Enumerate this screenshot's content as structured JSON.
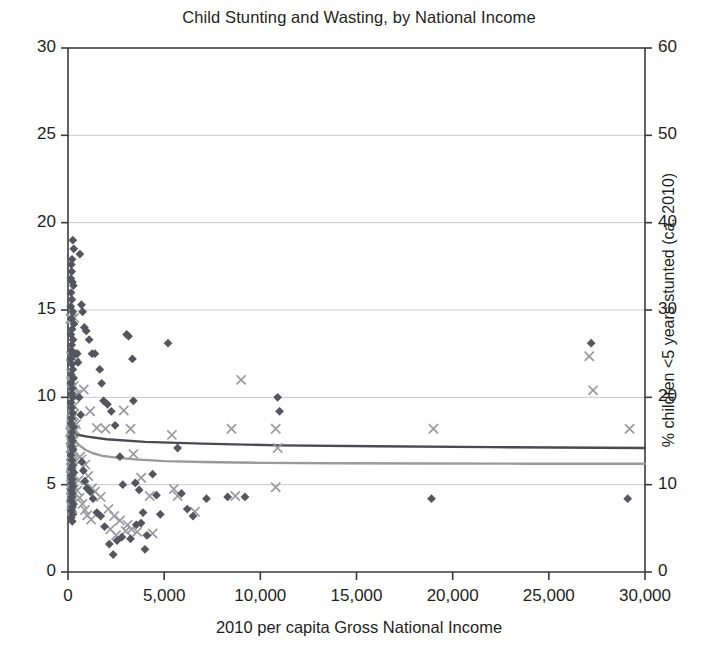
{
  "chart_data": {
    "type": "scatter",
    "title": "Child Stunting and Wasting, by National Income",
    "xlabel": "2010 per capita Gross National Income",
    "ylabel_left": "",
    "ylabel_right": "% children <5 years stunted (ca. 2010)",
    "xlim": [
      0,
      30000
    ],
    "ylim_left": [
      0,
      30
    ],
    "ylim_right": [
      0,
      60
    ],
    "xticks": [
      0,
      5000,
      10000,
      15000,
      20000,
      25000,
      30000
    ],
    "xticklabels": [
      "0",
      "5,000",
      "10,000",
      "15,000",
      "20,000",
      "25,000",
      "30,000"
    ],
    "yticks_left": [
      0,
      5,
      10,
      15,
      20,
      25,
      30
    ],
    "yticklabels_left": [
      "0",
      "5",
      "10",
      "15",
      "20",
      "25",
      "30"
    ],
    "yticks_right": [
      0,
      10,
      20,
      30,
      40,
      50,
      60
    ],
    "yticklabels_right": [
      "0",
      "10",
      "20",
      "30",
      "40",
      "50",
      "60"
    ],
    "grid": "horizontal",
    "legend_position": "none",
    "colors": {
      "stunting_marker": "#9a9a9e",
      "wasting_marker": "#55555f",
      "stunting_trend": "#9a9a9e",
      "wasting_trend": "#4a4a52",
      "axis": "#3a3a3a",
      "gridline": "#c8c8cc",
      "text": "#231f20"
    },
    "series": [
      {
        "name": "stunting",
        "marker": "x",
        "color": "#9a9a9e",
        "axis": "right",
        "points": [
          [
            120,
            29.0
          ],
          [
            200,
            29.0
          ],
          [
            330,
            29.1
          ],
          [
            150,
            24.7
          ],
          [
            250,
            24.7
          ],
          [
            380,
            24.8
          ],
          [
            160,
            22.7
          ],
          [
            180,
            21.9
          ],
          [
            200,
            21.6
          ],
          [
            300,
            21.3
          ],
          [
            240,
            20.3
          ],
          [
            360,
            20.2
          ],
          [
            430,
            20.3
          ],
          [
            330,
            19.0
          ],
          [
            180,
            18.4
          ],
          [
            260,
            18.0
          ],
          [
            210,
            17.8
          ],
          [
            170,
            17.2
          ],
          [
            300,
            17.0
          ],
          [
            160,
            16.8
          ],
          [
            420,
            16.9
          ],
          [
            200,
            16.5
          ],
          [
            150,
            16.2
          ],
          [
            360,
            16.3
          ],
          [
            110,
            16.0
          ],
          [
            250,
            15.9
          ],
          [
            190,
            15.5
          ],
          [
            140,
            15.2
          ],
          [
            320,
            15.1
          ],
          [
            170,
            14.8
          ],
          [
            230,
            14.5
          ],
          [
            130,
            14.2
          ],
          [
            280,
            14.0
          ],
          [
            190,
            13.6
          ],
          [
            150,
            13.3
          ],
          [
            210,
            13.0
          ],
          [
            250,
            12.7
          ],
          [
            170,
            12.3
          ],
          [
            140,
            11.9
          ],
          [
            200,
            11.5
          ],
          [
            160,
            11.2
          ],
          [
            230,
            10.9
          ],
          [
            180,
            10.6
          ],
          [
            300,
            10.3
          ],
          [
            150,
            10.0
          ],
          [
            210,
            9.7
          ],
          [
            170,
            9.4
          ],
          [
            250,
            9.1
          ],
          [
            190,
            8.8
          ],
          [
            140,
            8.5
          ],
          [
            220,
            8.2
          ],
          [
            180,
            7.9
          ],
          [
            160,
            7.6
          ],
          [
            240,
            7.3
          ],
          [
            200,
            7.0
          ],
          [
            820,
            20.9
          ],
          [
            1150,
            18.4
          ],
          [
            1500,
            16.5
          ],
          [
            1950,
            16.4
          ],
          [
            2900,
            18.5
          ],
          [
            3250,
            16.4
          ],
          [
            3400,
            13.5
          ],
          [
            3800,
            10.8
          ],
          [
            4250,
            8.7
          ],
          [
            5400,
            15.7
          ],
          [
            5500,
            9.5
          ],
          [
            5700,
            8.7
          ],
          [
            6600,
            6.9
          ],
          [
            8500,
            16.4
          ],
          [
            9000,
            22.0
          ],
          [
            8700,
            8.7
          ],
          [
            10800,
            16.4
          ],
          [
            10900,
            14.2
          ],
          [
            10800,
            9.7
          ],
          [
            19000,
            16.4
          ],
          [
            27100,
            24.7
          ],
          [
            27300,
            20.8
          ],
          [
            29200,
            16.4
          ],
          [
            620,
            13.2
          ],
          [
            700,
            12.9
          ],
          [
            900,
            12.3
          ],
          [
            1050,
            11.0
          ],
          [
            1250,
            9.6
          ],
          [
            1400,
            9.2
          ],
          [
            1700,
            8.6
          ],
          [
            2100,
            7.2
          ],
          [
            2400,
            6.4
          ],
          [
            2700,
            5.9
          ],
          [
            3100,
            5.4
          ],
          [
            3600,
            4.6
          ],
          [
            4400,
            4.4
          ],
          [
            550,
            10.5
          ],
          [
            480,
            9.3
          ],
          [
            600,
            8.5
          ],
          [
            750,
            7.8
          ],
          [
            880,
            7.1
          ],
          [
            1000,
            6.5
          ],
          [
            1200,
            6.0
          ],
          [
            2200,
            4.9
          ],
          [
            2500,
            4.2
          ],
          [
            3000,
            4.7
          ],
          [
            3300,
            4.9
          ]
        ]
      },
      {
        "name": "wasting",
        "marker": "diamond",
        "color": "#55555f",
        "axis": "left",
        "points": [
          [
            250,
            19.0
          ],
          [
            300,
            18.5
          ],
          [
            210,
            17.9
          ],
          [
            170,
            17.6
          ],
          [
            190,
            17.2
          ],
          [
            150,
            16.8
          ],
          [
            230,
            16.6
          ],
          [
            280,
            16.4
          ],
          [
            160,
            16.0
          ],
          [
            200,
            15.6
          ],
          [
            140,
            15.2
          ],
          [
            250,
            14.9
          ],
          [
            180,
            14.5
          ],
          [
            310,
            14.2
          ],
          [
            210,
            13.9
          ],
          [
            150,
            13.6
          ],
          [
            260,
            13.3
          ],
          [
            190,
            13.0
          ],
          [
            170,
            12.7
          ],
          [
            230,
            12.5
          ],
          [
            300,
            12.5
          ],
          [
            400,
            12.5
          ],
          [
            480,
            12.5
          ],
          [
            140,
            12.2
          ],
          [
            200,
            11.9
          ],
          [
            250,
            11.6
          ],
          [
            170,
            11.3
          ],
          [
            290,
            11.1
          ],
          [
            150,
            10.8
          ],
          [
            220,
            10.5
          ],
          [
            190,
            10.2
          ],
          [
            260,
            10.0
          ],
          [
            160,
            9.7
          ],
          [
            200,
            9.4
          ],
          [
            240,
            9.1
          ],
          [
            180,
            8.8
          ],
          [
            150,
            8.5
          ],
          [
            280,
            8.3
          ],
          [
            210,
            8.0
          ],
          [
            170,
            7.7
          ],
          [
            230,
            7.5
          ],
          [
            190,
            7.2
          ],
          [
            260,
            7.0
          ],
          [
            160,
            6.7
          ],
          [
            200,
            6.4
          ],
          [
            240,
            6.1
          ],
          [
            180,
            5.9
          ],
          [
            310,
            5.7
          ],
          [
            150,
            5.5
          ],
          [
            220,
            5.3
          ],
          [
            190,
            5.1
          ],
          [
            260,
            4.9
          ],
          [
            170,
            4.7
          ],
          [
            230,
            4.5
          ],
          [
            200,
            4.3
          ],
          [
            150,
            4.1
          ],
          [
            280,
            3.9
          ],
          [
            210,
            3.7
          ],
          [
            180,
            3.5
          ],
          [
            250,
            3.3
          ],
          [
            170,
            3.1
          ],
          [
            220,
            2.9
          ],
          [
            620,
            18.2
          ],
          [
            700,
            15.3
          ],
          [
            760,
            14.9
          ],
          [
            850,
            14.0
          ],
          [
            950,
            13.8
          ],
          [
            1100,
            13.3
          ],
          [
            1250,
            12.5
          ],
          [
            1400,
            12.5
          ],
          [
            1650,
            11.6
          ],
          [
            1750,
            10.8
          ],
          [
            1850,
            9.8
          ],
          [
            2050,
            9.6
          ],
          [
            2250,
            9.2
          ],
          [
            2450,
            8.4
          ],
          [
            2700,
            6.6
          ],
          [
            2850,
            5.0
          ],
          [
            3050,
            13.6
          ],
          [
            3150,
            13.5
          ],
          [
            3350,
            12.2
          ],
          [
            3400,
            9.8
          ],
          [
            3500,
            5.1
          ],
          [
            3700,
            4.7
          ],
          [
            3900,
            3.4
          ],
          [
            4100,
            2.1
          ],
          [
            4400,
            5.6
          ],
          [
            4600,
            4.4
          ],
          [
            4800,
            3.3
          ],
          [
            5200,
            13.1
          ],
          [
            5700,
            7.1
          ],
          [
            5900,
            4.5
          ],
          [
            6200,
            3.6
          ],
          [
            6500,
            3.2
          ],
          [
            7200,
            4.2
          ],
          [
            8300,
            4.3
          ],
          [
            9200,
            4.3
          ],
          [
            10900,
            10.0
          ],
          [
            11000,
            9.2
          ],
          [
            18900,
            4.2
          ],
          [
            27200,
            13.1
          ],
          [
            29100,
            4.2
          ],
          [
            520,
            12.0
          ],
          [
            580,
            10.0
          ],
          [
            660,
            9.0
          ],
          [
            720,
            6.3
          ],
          [
            800,
            5.8
          ],
          [
            880,
            5.2
          ],
          [
            980,
            4.8
          ],
          [
            1150,
            4.6
          ],
          [
            1300,
            4.2
          ],
          [
            1500,
            3.4
          ],
          [
            1700,
            3.2
          ],
          [
            1900,
            2.6
          ],
          [
            2150,
            1.6
          ],
          [
            2350,
            1.0
          ],
          [
            2550,
            1.8
          ],
          [
            2800,
            2.0
          ],
          [
            3250,
            1.9
          ],
          [
            3550,
            2.7
          ],
          [
            3800,
            2.8
          ],
          [
            4000,
            1.3
          ]
        ]
      }
    ],
    "trendlines": [
      {
        "name": "stunting-trend",
        "color": "#9a9a9e",
        "axis": "right",
        "description": "logarithmic decline from ~16.5 at low income to ~12.4 at 30,000",
        "points": [
          [
            30,
            17.2
          ],
          [
            80,
            16.4
          ],
          [
            150,
            15.8
          ],
          [
            250,
            15.3
          ],
          [
            400,
            14.9
          ],
          [
            600,
            14.5
          ],
          [
            900,
            14.0
          ],
          [
            1300,
            13.6
          ],
          [
            1800,
            13.3
          ],
          [
            2500,
            13.1
          ],
          [
            3500,
            12.9
          ],
          [
            5000,
            12.7
          ],
          [
            7000,
            12.6
          ],
          [
            10000,
            12.5
          ],
          [
            14000,
            12.45
          ],
          [
            19000,
            12.42
          ],
          [
            24000,
            12.4
          ],
          [
            30000,
            12.4
          ]
        ]
      },
      {
        "name": "wasting-trend",
        "color": "#4a4a52",
        "axis": "left",
        "description": "nearly flat slight decline from ~7.9 to ~7.1",
        "points": [
          [
            30,
            7.95
          ],
          [
            300,
            7.9
          ],
          [
            1000,
            7.75
          ],
          [
            2000,
            7.6
          ],
          [
            4000,
            7.45
          ],
          [
            7000,
            7.35
          ],
          [
            11000,
            7.25
          ],
          [
            16000,
            7.2
          ],
          [
            22000,
            7.15
          ],
          [
            30000,
            7.1
          ]
        ]
      }
    ]
  },
  "axis_titles": {
    "x": "2010 per capita Gross National Income",
    "y_right": "% children <5 years stunted (ca. 2010)"
  }
}
